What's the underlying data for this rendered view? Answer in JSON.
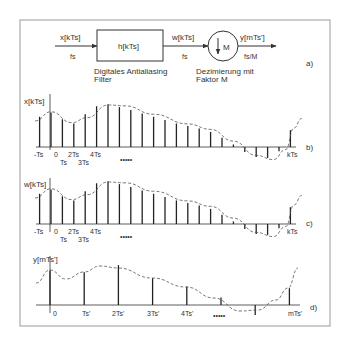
{
  "colors": {
    "frame": "#9a9a9a",
    "line": "#333333",
    "stem": "#222222",
    "dashed": "#555555",
    "text": "#333333"
  },
  "block_diagram": {
    "label": "a)",
    "input_signal": "x[kTs]",
    "input_rate": "fs",
    "filter_label": "h[kTs]",
    "filter_caption_line1": "Digitales Antialiasing",
    "filter_caption_line2": "Filter",
    "mid_signal": "w[kTs]",
    "mid_rate": "fs",
    "decimator_symbol": "M",
    "decimator_caption_line1": "Dezimierung mit",
    "decimator_caption_line2": "Faktor M",
    "output_signal": "y[mTs']",
    "output_rate": "fs/M"
  },
  "chart_data": [
    {
      "type": "stem",
      "panel": "b)",
      "ylabel": "x[kTs]",
      "xlabel": "kTs",
      "tick_labels_row1": [
        "-Ts",
        "0",
        "2Ts",
        "4Ts"
      ],
      "tick_labels_row2": [
        "Ts",
        "3Ts"
      ],
      "ellipsis": "•••••",
      "k": [
        -1,
        0,
        1,
        2,
        3,
        4,
        5,
        6,
        7,
        8,
        9,
        10,
        11,
        12,
        13,
        14,
        15,
        16,
        17,
        18,
        19,
        20,
        21
      ],
      "values": [
        0.72,
        0.82,
        0.66,
        0.56,
        0.78,
        0.97,
        1.02,
        0.95,
        0.88,
        0.8,
        0.72,
        0.64,
        0.56,
        0.5,
        0.44,
        0.36,
        0.22,
        0.06,
        -0.12,
        -0.24,
        -0.26,
        -0.1,
        0.4
      ]
    },
    {
      "type": "stem",
      "panel": "c)",
      "ylabel": "w[kTs]",
      "xlabel": "kTs",
      "tick_labels_row1": [
        "-Ts",
        "0",
        "2Ts",
        "4Ts"
      ],
      "tick_labels_row2": [
        "Ts",
        "3Ts"
      ],
      "ellipsis": "•••••",
      "k": [
        -1,
        0,
        1,
        2,
        3,
        4,
        5,
        6,
        7,
        8,
        9,
        10,
        11,
        12,
        13,
        14,
        15,
        16,
        17,
        18,
        19,
        20,
        21
      ],
      "values": [
        0.72,
        0.82,
        0.66,
        0.56,
        0.78,
        0.97,
        1.02,
        0.95,
        0.88,
        0.8,
        0.72,
        0.64,
        0.56,
        0.5,
        0.44,
        0.36,
        0.22,
        0.06,
        -0.12,
        -0.24,
        -0.26,
        -0.1,
        0.4
      ]
    },
    {
      "type": "stem",
      "panel": "d)",
      "ylabel": "y[mTs']",
      "xlabel": "mTs'",
      "tick_labels": [
        "0",
        "Ts'",
        "2Ts'",
        "3Ts'",
        "4Ts'"
      ],
      "ellipsis": "•••••",
      "m": [
        0,
        1,
        2,
        3,
        4,
        5,
        6,
        7
      ],
      "values": [
        0.82,
        0.78,
        0.95,
        0.64,
        0.44,
        0.18,
        -0.24,
        0.4
      ]
    }
  ]
}
